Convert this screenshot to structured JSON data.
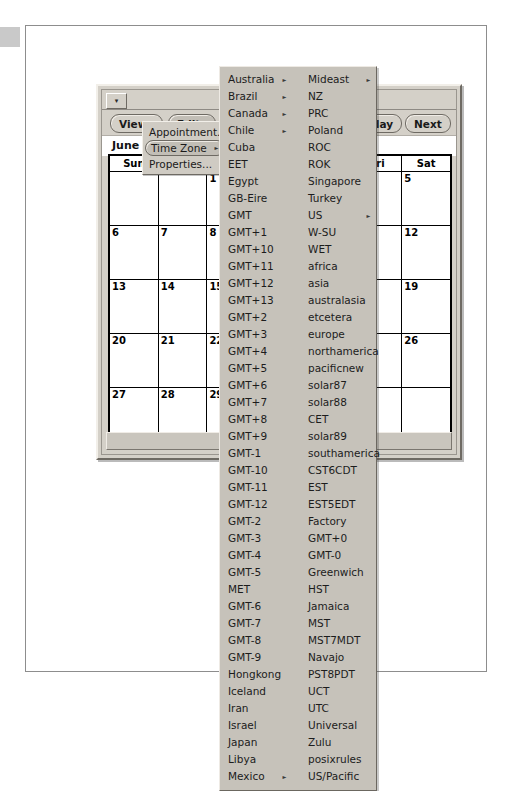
{
  "window": {
    "title": "Calendar",
    "title_visible_prefix": "Cal",
    "title_visible_suffix": "y",
    "menu_button_glyph": "▾"
  },
  "toolbar": {
    "view_label": "View",
    "view_caret": "▾",
    "edit_label": "Edit",
    "edit_caret": "▾",
    "insert_label": "I",
    "today_label": "Today",
    "next_label": "Next"
  },
  "month": {
    "label": "June"
  },
  "calendar": {
    "headers": [
      "Sun",
      "Mon",
      "Tue",
      "Wed",
      "Thu",
      "Fri",
      "Sat"
    ],
    "header_visible": [
      "Sun",
      "Mon",
      "",
      "",
      "",
      "ri",
      "Sat"
    ],
    "weeks": [
      [
        "",
        "",
        "1",
        "2",
        "3",
        "4",
        "5"
      ],
      [
        "6",
        "7",
        "8",
        "9",
        "10",
        "11",
        "12"
      ],
      [
        "13",
        "14",
        "15",
        "16",
        "17",
        "18",
        "19"
      ],
      [
        "20",
        "21",
        "22",
        "23",
        "24",
        "25",
        "26"
      ],
      [
        "27",
        "28",
        "29",
        "30",
        "",
        "",
        ""
      ]
    ]
  },
  "edit_menu": {
    "items": [
      {
        "label": "Appointment...",
        "submenu": false,
        "highlighted": false
      },
      {
        "label": "Time Zone",
        "submenu": true,
        "highlighted": true
      },
      {
        "label": "Properties...",
        "submenu": false,
        "highlighted": false
      }
    ],
    "submenu_arrow": "▸"
  },
  "timezone_menu": {
    "submenu_arrow": "▸",
    "left_column": [
      {
        "label": "Australia",
        "submenu": true
      },
      {
        "label": "Brazil",
        "submenu": true
      },
      {
        "label": "Canada",
        "submenu": true
      },
      {
        "label": "Chile",
        "submenu": true
      },
      {
        "label": "Cuba",
        "submenu": false
      },
      {
        "label": "EET",
        "submenu": false
      },
      {
        "label": "Egypt",
        "submenu": false
      },
      {
        "label": "GB-Eire",
        "submenu": false
      },
      {
        "label": "GMT",
        "submenu": false
      },
      {
        "label": "GMT+1",
        "submenu": false
      },
      {
        "label": "GMT+10",
        "submenu": false
      },
      {
        "label": "GMT+11",
        "submenu": false
      },
      {
        "label": "GMT+12",
        "submenu": false
      },
      {
        "label": "GMT+13",
        "submenu": false
      },
      {
        "label": "GMT+2",
        "submenu": false
      },
      {
        "label": "GMT+3",
        "submenu": false
      },
      {
        "label": "GMT+4",
        "submenu": false
      },
      {
        "label": "GMT+5",
        "submenu": false
      },
      {
        "label": "GMT+6",
        "submenu": false
      },
      {
        "label": "GMT+7",
        "submenu": false
      },
      {
        "label": "GMT+8",
        "submenu": false
      },
      {
        "label": "GMT+9",
        "submenu": false
      },
      {
        "label": "GMT-1",
        "submenu": false
      },
      {
        "label": "GMT-10",
        "submenu": false
      },
      {
        "label": "GMT-11",
        "submenu": false
      },
      {
        "label": "GMT-12",
        "submenu": false
      },
      {
        "label": "GMT-2",
        "submenu": false
      },
      {
        "label": "GMT-3",
        "submenu": false
      },
      {
        "label": "GMT-4",
        "submenu": false
      },
      {
        "label": "GMT-5",
        "submenu": false
      },
      {
        "label": "MET",
        "submenu": false
      },
      {
        "label": "GMT-6",
        "submenu": false
      },
      {
        "label": "GMT-7",
        "submenu": false
      },
      {
        "label": "GMT-8",
        "submenu": false
      },
      {
        "label": "GMT-9",
        "submenu": false
      },
      {
        "label": "Hongkong",
        "submenu": false
      },
      {
        "label": "Iceland",
        "submenu": false
      },
      {
        "label": "Iran",
        "submenu": false
      },
      {
        "label": "Israel",
        "submenu": false
      },
      {
        "label": "Japan",
        "submenu": false
      },
      {
        "label": "Libya",
        "submenu": false
      },
      {
        "label": "Mexico",
        "submenu": true
      }
    ],
    "right_column": [
      {
        "label": "Mideast",
        "submenu": true
      },
      {
        "label": "NZ",
        "submenu": false
      },
      {
        "label": "PRC",
        "submenu": false
      },
      {
        "label": "Poland",
        "submenu": false
      },
      {
        "label": "ROC",
        "submenu": false
      },
      {
        "label": "ROK",
        "submenu": false
      },
      {
        "label": "Singapore",
        "submenu": false
      },
      {
        "label": "Turkey",
        "submenu": false
      },
      {
        "label": "US",
        "submenu": true
      },
      {
        "label": "W-SU",
        "submenu": false
      },
      {
        "label": "WET",
        "submenu": false
      },
      {
        "label": "africa",
        "submenu": false
      },
      {
        "label": "asia",
        "submenu": false
      },
      {
        "label": "australasia",
        "submenu": false
      },
      {
        "label": "etcetera",
        "submenu": false
      },
      {
        "label": "europe",
        "submenu": false
      },
      {
        "label": "northamerica",
        "submenu": false
      },
      {
        "label": "pacificnew",
        "submenu": false
      },
      {
        "label": "solar87",
        "submenu": false
      },
      {
        "label": "solar88",
        "submenu": false
      },
      {
        "label": "CET",
        "submenu": false
      },
      {
        "label": "solar89",
        "submenu": false
      },
      {
        "label": "southamerica",
        "submenu": false
      },
      {
        "label": "CST6CDT",
        "submenu": false
      },
      {
        "label": "EST",
        "submenu": false
      },
      {
        "label": "EST5EDT",
        "submenu": false
      },
      {
        "label": "Factory",
        "submenu": false
      },
      {
        "label": "GMT+0",
        "submenu": false
      },
      {
        "label": "GMT-0",
        "submenu": false
      },
      {
        "label": "Greenwich",
        "submenu": false
      },
      {
        "label": "HST",
        "submenu": false
      },
      {
        "label": "Jamaica",
        "submenu": false
      },
      {
        "label": "MST",
        "submenu": false
      },
      {
        "label": "MST7MDT",
        "submenu": false
      },
      {
        "label": "Navajo",
        "submenu": false
      },
      {
        "label": "PST8PDT",
        "submenu": false
      },
      {
        "label": "UCT",
        "submenu": false
      },
      {
        "label": "UTC",
        "submenu": false
      },
      {
        "label": "Universal",
        "submenu": false
      },
      {
        "label": "Zulu",
        "submenu": false
      },
      {
        "label": "posixrules",
        "submenu": false
      },
      {
        "label": "US/Pacific",
        "submenu": false
      }
    ]
  },
  "colors": {
    "page_background": "#ffffff",
    "window_face": "#d4d0c8",
    "menu_face": "#c6c2ba",
    "menu_highlight": "#c2beb6",
    "border_dark": "#6e6a63",
    "border_light": "#f2efe9",
    "text": "#1a1a1a"
  }
}
